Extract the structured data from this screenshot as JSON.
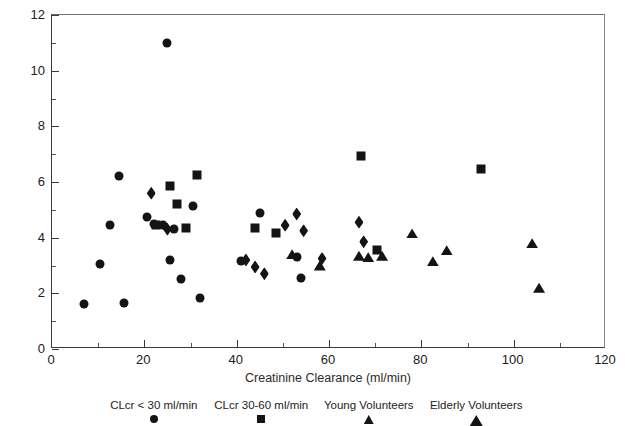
{
  "chart_data": {
    "type": "scatter",
    "title": "",
    "xlabel": "Creatinine Clearance (ml/min)",
    "ylabel": "Torsemide Half-Life (hr)",
    "xlim": [
      0,
      120
    ],
    "ylim": [
      0,
      12
    ],
    "xticks": [
      0,
      20,
      40,
      60,
      80,
      100,
      120
    ],
    "yticks": [
      0,
      2,
      4,
      6,
      8,
      10,
      12
    ],
    "xminor_ticks": [
      10,
      30,
      50,
      70,
      90,
      110
    ],
    "yminor_ticks": [
      1,
      3,
      5,
      7,
      9,
      11
    ],
    "grid": false,
    "legend_position": "below-axis",
    "series": [
      {
        "name": "CLcr < 30 ml/min",
        "marker": "circle",
        "points": [
          [
            7.0,
            1.6
          ],
          [
            10.5,
            3.05
          ],
          [
            12.5,
            4.45
          ],
          [
            14.5,
            6.2
          ],
          [
            15.5,
            1.65
          ],
          [
            20.5,
            4.75
          ],
          [
            22.0,
            4.5
          ],
          [
            24.0,
            4.45
          ],
          [
            25.0,
            11.0
          ],
          [
            25.5,
            3.2
          ],
          [
            26.5,
            4.3
          ],
          [
            28.0,
            2.5
          ],
          [
            30.5,
            5.15
          ],
          [
            32.0,
            1.85
          ],
          [
            41.0,
            3.15
          ],
          [
            45.0,
            4.9
          ],
          [
            53.0,
            3.3
          ],
          [
            54.0,
            2.55
          ]
        ]
      },
      {
        "name": "CLcr 30-60 ml/min",
        "marker": "square",
        "points": [
          [
            22.5,
            4.45
          ],
          [
            25.5,
            5.85
          ],
          [
            27.0,
            5.2
          ],
          [
            29.0,
            4.35
          ],
          [
            31.5,
            6.25
          ],
          [
            44.0,
            4.35
          ],
          [
            48.5,
            4.15
          ],
          [
            67.0,
            6.95
          ],
          [
            70.5,
            3.55
          ],
          [
            93.0,
            6.45
          ]
        ]
      },
      {
        "name": "Young Volunteers",
        "marker": "triangle",
        "points": [
          [
            52.0,
            3.4
          ],
          [
            58.0,
            3.0
          ],
          [
            66.5,
            3.35
          ],
          [
            68.5,
            3.3
          ],
          [
            71.5,
            3.35
          ],
          [
            78.0,
            4.15
          ],
          [
            82.5,
            3.15
          ],
          [
            85.5,
            3.55
          ]
        ]
      },
      {
        "name": "Elderly Volunteers",
        "marker": "triangle",
        "points": [
          [
            104.0,
            3.8
          ],
          [
            105.5,
            2.2
          ]
        ]
      },
      {
        "name": "diamond-group",
        "marker": "diamond",
        "points": [
          [
            21.5,
            5.6
          ],
          [
            25.0,
            4.3
          ],
          [
            42.0,
            3.2
          ],
          [
            44.0,
            2.95
          ],
          [
            46.0,
            2.7
          ],
          [
            50.5,
            4.45
          ],
          [
            53.0,
            4.85
          ],
          [
            54.5,
            4.25
          ],
          [
            58.5,
            3.25
          ],
          [
            66.5,
            4.55
          ],
          [
            67.5,
            3.85
          ]
        ]
      }
    ]
  },
  "legend": {
    "entries": [
      {
        "label": "CLcr < 30 ml/min",
        "marker": "circle-marker"
      },
      {
        "label": "CLcr 30-60 ml/min",
        "marker": "square-marker"
      },
      {
        "label": "Young Volunteers",
        "marker": "triangle-marker"
      },
      {
        "label": "Elderly Volunteers",
        "marker": "triangle-large-marker"
      }
    ]
  }
}
